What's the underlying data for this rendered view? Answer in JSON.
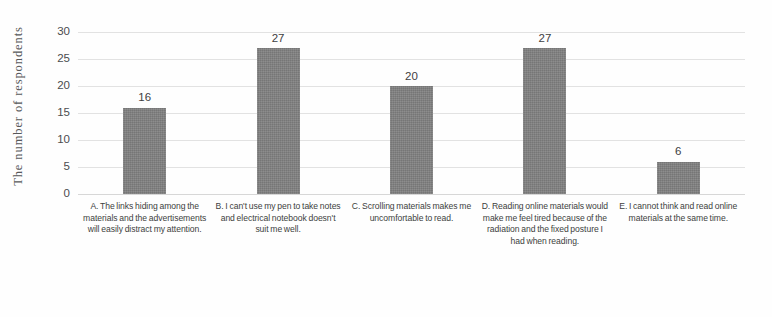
{
  "chart_data": {
    "type": "bar",
    "title": "",
    "xlabel": "",
    "ylabel": "The number  of respondents",
    "categories": [
      "A. The links hiding among the materials and the advertisements will easily distract my attention.",
      "B. I can't use my pen to take notes and electrical notebook doesn't suit me well.",
      "C. Scrolling materials makes me uncomfortable to read.",
      "D. Reading online materials would make me feel tired because of the radiation and the fixed posture I had when reading.",
      "E. I cannot think and read online materials at the same time."
    ],
    "values": [
      16,
      27,
      20,
      27,
      6
    ],
    "value_labels": [
      "16",
      "27",
      "20",
      "27",
      "6"
    ],
    "ylim": [
      0,
      30
    ],
    "y_ticks": [
      0,
      5,
      10,
      15,
      20,
      25,
      30
    ],
    "y_tick_labels": [
      "0",
      "5",
      "10",
      "15",
      "20",
      "25",
      "30"
    ],
    "grid": true,
    "legend": false,
    "bar_color": "#808080",
    "gridline_color": "#d8d8d8",
    "text_color": "#3f4042"
  }
}
